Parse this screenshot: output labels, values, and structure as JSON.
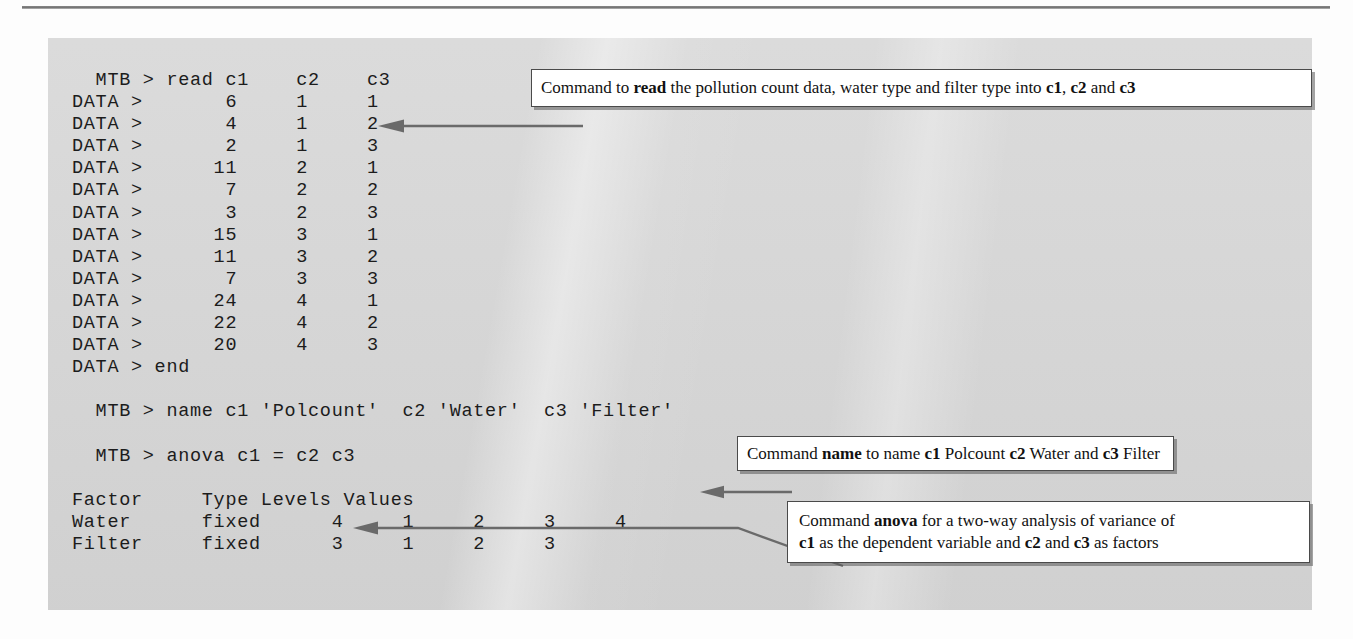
{
  "panel": {
    "background_color": "#d7d7d7",
    "console": {
      "lines": [
        "  MTB > read c1    c2    c3",
        "DATA >       6     1     1",
        "DATA >       4     1     2",
        "DATA >       2     1     3",
        "DATA >      11     2     1",
        "DATA >       7     2     2",
        "DATA >       3     2     3",
        "DATA >      15     3     1",
        "DATA >      11     3     2",
        "DATA >       7     3     3",
        "DATA >      24     4     1",
        "DATA >      22     4     2",
        "DATA >      20     4     3",
        "DATA > end",
        "",
        "  MTB > name c1 'Polcount'  c2 'Water'  c3 'Filter'",
        "",
        "  MTB > anova c1 = c2 c3",
        "",
        "Factor     Type Levels Values",
        "Water      fixed      4     1     2     3     4",
        "Filter     fixed      3     1     2     3"
      ]
    },
    "session": {
      "prompt_command": "MTB >",
      "data_prompt": "DATA >",
      "read_command": "read c1 c2 c3",
      "name_command": "name c1 'Polcount' c2 'Water' c3 'Filter'",
      "anova_command": "anova c1 = c2 c3",
      "end_keyword": "end",
      "data_table": {
        "columns": [
          "c1",
          "c2",
          "c3"
        ],
        "column_names": [
          "Polcount",
          "Water",
          "Filter"
        ],
        "rows": [
          [
            6,
            1,
            1
          ],
          [
            4,
            1,
            2
          ],
          [
            2,
            1,
            3
          ],
          [
            11,
            2,
            1
          ],
          [
            7,
            2,
            2
          ],
          [
            3,
            2,
            3
          ],
          [
            15,
            3,
            1
          ],
          [
            11,
            3,
            2
          ],
          [
            7,
            3,
            3
          ],
          [
            24,
            4,
            1
          ],
          [
            22,
            4,
            2
          ],
          [
            20,
            4,
            3
          ]
        ]
      },
      "factor_table": {
        "headers": [
          "Factor",
          "Type",
          "Levels",
          "Values"
        ],
        "rows": [
          {
            "factor": "Water",
            "type": "fixed",
            "levels": 4,
            "values": [
              1,
              2,
              3,
              4
            ]
          },
          {
            "factor": "Filter",
            "type": "fixed",
            "levels": 3,
            "values": [
              1,
              2,
              3
            ]
          }
        ]
      }
    }
  },
  "callouts": [
    {
      "id": "read",
      "segments": [
        {
          "text": "Command to ",
          "bold": false
        },
        {
          "text": "read",
          "bold": true
        },
        {
          "text": " the pollution count data, water type and filter type into ",
          "bold": false
        },
        {
          "text": "c1",
          "bold": true
        },
        {
          "text": ", ",
          "bold": false
        },
        {
          "text": "c2",
          "bold": true
        },
        {
          "text": " and ",
          "bold": false
        },
        {
          "text": "c3",
          "bold": true
        }
      ],
      "plain": "Command to read the pollution count data, water type and filter type into c1, c2 and c3"
    },
    {
      "id": "name",
      "segments": [
        {
          "text": "Command ",
          "bold": false
        },
        {
          "text": "name",
          "bold": true
        },
        {
          "text": " to name ",
          "bold": false
        },
        {
          "text": "c1",
          "bold": true
        },
        {
          "text": " Polcount ",
          "bold": false
        },
        {
          "text": "c2",
          "bold": true
        },
        {
          "text": " Water and ",
          "bold": false
        },
        {
          "text": "c3",
          "bold": true
        },
        {
          "text": " Filter",
          "bold": false
        }
      ],
      "plain": "Command name to name c1 Polcount c2 Water and c3 Filter"
    },
    {
      "id": "anova",
      "segments": [
        {
          "text": "Command ",
          "bold": false
        },
        {
          "text": "anova",
          "bold": true
        },
        {
          "text": " for a two-way analysis of variance of",
          "bold": false
        },
        {
          "text": "\n",
          "bold": false
        },
        {
          "text": "c1",
          "bold": true
        },
        {
          "text": " as the dependent variable and ",
          "bold": false
        },
        {
          "text": "c2",
          "bold": true
        },
        {
          "text": " and ",
          "bold": false
        },
        {
          "text": "c3",
          "bold": true
        },
        {
          "text": " as factors",
          "bold": false
        }
      ],
      "plain": "Command anova for a two-way analysis of variance of c1 as the dependent variable and c2 and c3 as factors"
    }
  ],
  "colors": {
    "panel": "#d7d7d7",
    "text": "#1c1c1c",
    "callout_border": "#4a4a4a",
    "leader_line": "#6a6a6a",
    "rule": "#7a7a7a"
  }
}
